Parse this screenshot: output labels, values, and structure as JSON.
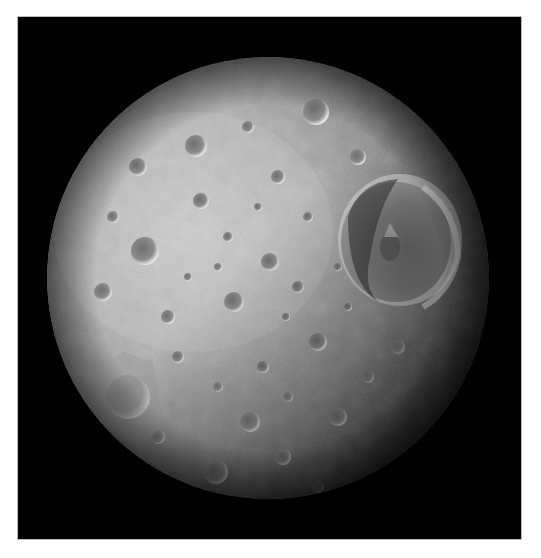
{
  "image": {
    "subject": "Cratered moon (Mimas) with large crater Herschel",
    "alt": "Grayscale photograph of a heavily cratered spherical moon against black space, with a very large crater on the right side",
    "background_color": "#000000",
    "page_color": "#ffffff",
    "frame": {
      "left": 18,
      "top": 17,
      "width": 503,
      "height": 522
    },
    "sphere": {
      "cx": 250,
      "cy": 261,
      "r": 221,
      "lit_color": "#c9c9c9",
      "mid_color": "#8f8f8f",
      "shadow_color": "#1a1a1a"
    },
    "large_crater": {
      "label": "large-crater",
      "cx": 382,
      "cy": 223,
      "r": 62
    },
    "notable_craters": [
      {
        "cx": 127,
        "cy": 234,
        "r": 14
      },
      {
        "cx": 110,
        "cy": 380,
        "r": 22
      },
      {
        "cx": 178,
        "cy": 129,
        "r": 11
      },
      {
        "cx": 298,
        "cy": 95,
        "r": 13
      },
      {
        "cx": 216,
        "cy": 285,
        "r": 10
      },
      {
        "cx": 252,
        "cy": 245,
        "r": 9
      },
      {
        "cx": 183,
        "cy": 184,
        "r": 8
      },
      {
        "cx": 300,
        "cy": 325,
        "r": 9
      },
      {
        "cx": 232,
        "cy": 405,
        "r": 10
      },
      {
        "cx": 198,
        "cy": 455,
        "r": 12
      },
      {
        "cx": 265,
        "cy": 440,
        "r": 8
      },
      {
        "cx": 320,
        "cy": 400,
        "r": 9
      },
      {
        "cx": 150,
        "cy": 300,
        "r": 7
      },
      {
        "cx": 85,
        "cy": 275,
        "r": 9
      },
      {
        "cx": 340,
        "cy": 140,
        "r": 8
      },
      {
        "cx": 260,
        "cy": 160,
        "r": 7
      },
      {
        "cx": 120,
        "cy": 150,
        "r": 9
      }
    ]
  },
  "caption": ""
}
